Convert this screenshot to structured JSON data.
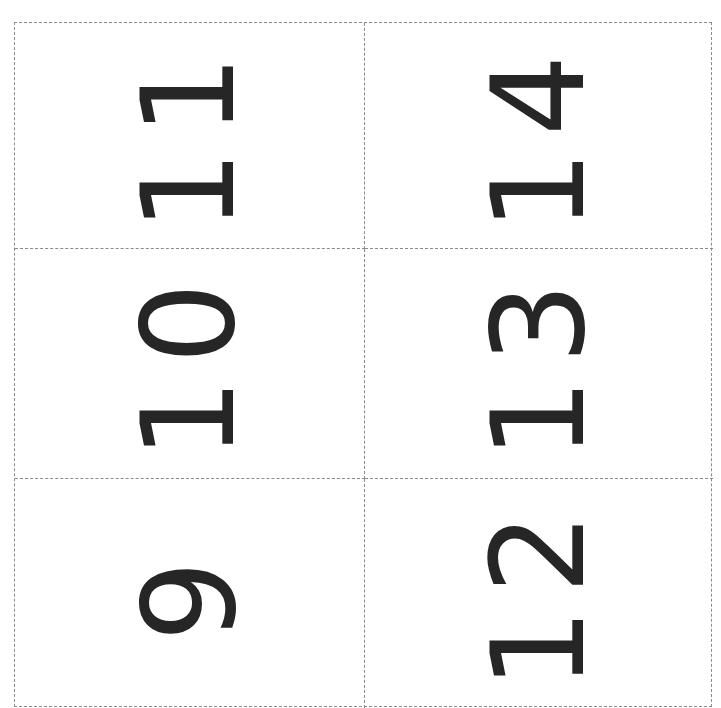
{
  "sheet": {
    "layout": "2 columns x 3 rows, dashed cut lines",
    "orientation": "numbers rotated 90 degrees counter-clockwise",
    "ink_color": "#262626",
    "cut_line_color": "#8a8a8a",
    "cards": [
      {
        "row": 0,
        "col": 0,
        "value": "11"
      },
      {
        "row": 0,
        "col": 1,
        "value": "14"
      },
      {
        "row": 1,
        "col": 0,
        "value": "10"
      },
      {
        "row": 1,
        "col": 1,
        "value": "13"
      },
      {
        "row": 2,
        "col": 0,
        "value": "9"
      },
      {
        "row": 2,
        "col": 1,
        "value": "12"
      }
    ]
  }
}
